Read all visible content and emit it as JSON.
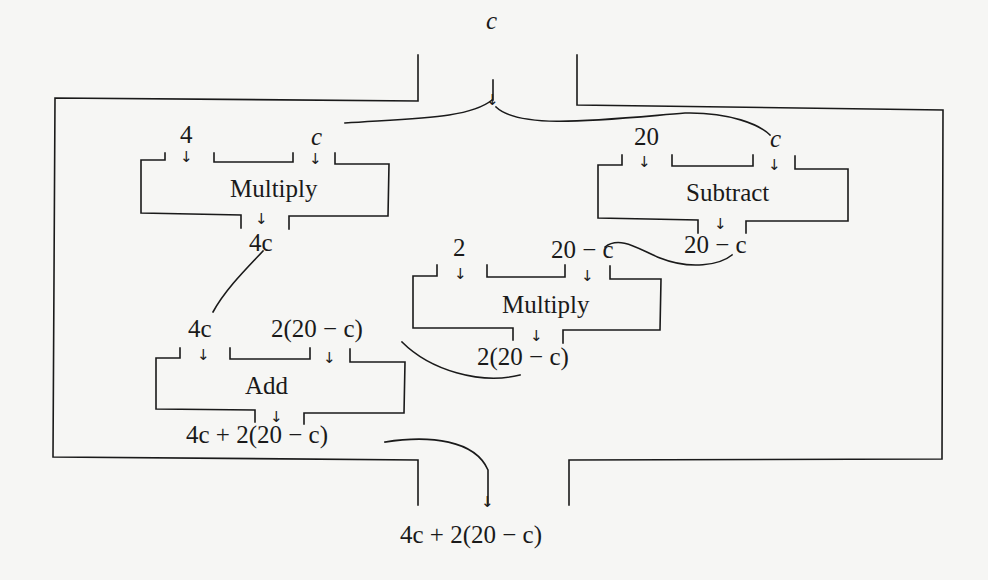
{
  "diagram": {
    "input": "c",
    "output": "4c + 2(20 − c)",
    "colors": {
      "line": "#1a1a1a",
      "background": "#f6f6f4"
    },
    "boxes": {
      "multiply1": {
        "title": "Multiply",
        "input_left": "4",
        "input_right": "c",
        "output": "4c"
      },
      "subtract": {
        "title": "Subtract",
        "input_left": "20",
        "input_right": "c",
        "output": "20 − c"
      },
      "multiply2": {
        "title": "Multiply",
        "input_left": "2",
        "input_right": "20 − c",
        "output": "2(20 − c)"
      },
      "add": {
        "title": "Add",
        "input_left": "4c",
        "input_right": "2(20 − c)",
        "output": "4c + 2(20 − c)"
      }
    },
    "arrow_glyph": "↓"
  }
}
